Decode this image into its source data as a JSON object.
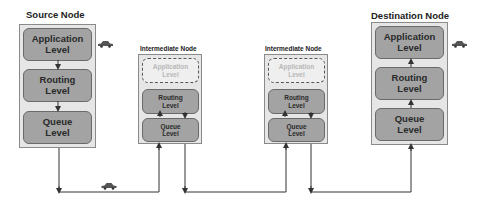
{
  "diagram": {
    "source_node": {
      "title": "Source Node",
      "levels": [
        "Application\nLevel",
        "Routing\nLevel",
        "Queue\nLevel"
      ]
    },
    "intermediate_node_1": {
      "title": "Intermediate  Node",
      "levels": [
        "Application\nLevel",
        "Routing\nLevel",
        "Queue\nLevel"
      ],
      "inactive_level": "Application Level"
    },
    "intermediate_node_2": {
      "title": "Intermediate  Node",
      "levels": [
        "Application\nLevel",
        "Routing\nLevel",
        "Queue\nLevel"
      ],
      "inactive_level": "Application Level"
    },
    "destination_node": {
      "title": "Destination Node",
      "levels": [
        "Application\nLevel",
        "Routing\nLevel",
        "Queue\nLevel"
      ]
    },
    "icons": [
      "car-icon",
      "car-icon",
      "car-icon"
    ],
    "colors": {
      "node_bg": "#e6e6e6",
      "level_fill": "#a3a3a3",
      "ghost_text": "#b8b8b8",
      "line": "#333333"
    }
  }
}
